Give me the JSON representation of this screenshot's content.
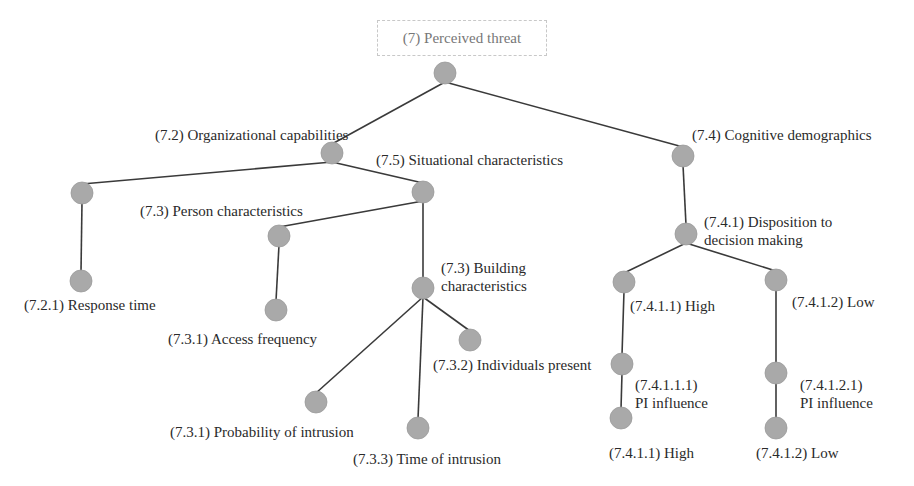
{
  "diagram": {
    "type": "tree",
    "root_label": "(7) Perceived threat",
    "colors": {
      "node_fill": "#a9a9a9",
      "edge": "#3a3a3a",
      "text": "#2a2a2a",
      "root_text": "#777777"
    },
    "labels": {
      "org_capabilities": "(7.2) Organizational capabilities",
      "situational": "(7.5) Situational characteristics",
      "cognitive": "(7.4) Cognitive demographics",
      "person": "(7.3) Person characteristics",
      "response_time": "(7.2.1) Response time",
      "access_frequency": "(7.3.1) Access frequency",
      "building_l1": "(7.3) Building",
      "building_l2": "characteristics",
      "individuals_present": "(7.3.2) Individuals present",
      "probability": "(7.3.1) Probability of intrusion",
      "time_intrusion": "(7.3.3) Time of intrusion",
      "disposition_l1": "(7.4.1) Disposition to",
      "disposition_l2": "decision making",
      "high": "(7.4.1.1) High",
      "low": "(7.4.1.2) Low",
      "pi_high_l1": "(7.4.1.1.1)",
      "pi_high_l2": "PI influence",
      "pi_low_l1": "(7.4.1.2.1)",
      "pi_low_l2": "PI influence",
      "leaf_high": "(7.4.1.1) High",
      "leaf_low": "(7.4.1.2) Low"
    },
    "nodes": [
      {
        "id": "root",
        "x": 445,
        "y": 73
      },
      {
        "id": "n72",
        "x": 332,
        "y": 153
      },
      {
        "id": "n74",
        "x": 683,
        "y": 156
      },
      {
        "id": "n72a",
        "x": 82,
        "y": 193
      },
      {
        "id": "n75",
        "x": 423,
        "y": 192
      },
      {
        "id": "n721",
        "x": 81,
        "y": 281
      },
      {
        "id": "n73p",
        "x": 279,
        "y": 236
      },
      {
        "id": "n731a",
        "x": 276,
        "y": 310
      },
      {
        "id": "n73b",
        "x": 423,
        "y": 288
      },
      {
        "id": "n731p",
        "x": 316,
        "y": 402
      },
      {
        "id": "n733",
        "x": 418,
        "y": 428
      },
      {
        "id": "n732",
        "x": 470,
        "y": 340
      },
      {
        "id": "n741",
        "x": 686,
        "y": 234
      },
      {
        "id": "n7411",
        "x": 624,
        "y": 282
      },
      {
        "id": "n7412",
        "x": 776,
        "y": 280
      },
      {
        "id": "n74111",
        "x": 622,
        "y": 364
      },
      {
        "id": "n74121",
        "x": 776,
        "y": 373
      },
      {
        "id": "leafH",
        "x": 621,
        "y": 418
      },
      {
        "id": "leafL",
        "x": 776,
        "y": 428
      }
    ],
    "edges": [
      [
        "root",
        "n72"
      ],
      [
        "root",
        "n74"
      ],
      [
        "n72",
        "n72a"
      ],
      [
        "n72",
        "n75"
      ],
      [
        "n72a",
        "n721"
      ],
      [
        "n75",
        "n73p"
      ],
      [
        "n75",
        "n73b"
      ],
      [
        "n73p",
        "n731a"
      ],
      [
        "n73b",
        "n731p"
      ],
      [
        "n73b",
        "n733"
      ],
      [
        "n73b",
        "n732"
      ],
      [
        "n74",
        "n741"
      ],
      [
        "n741",
        "n7411"
      ],
      [
        "n741",
        "n7412"
      ],
      [
        "n7411",
        "n74111"
      ],
      [
        "n7412",
        "n74121"
      ],
      [
        "n74111",
        "leafH"
      ],
      [
        "n74121",
        "leafL"
      ]
    ]
  }
}
